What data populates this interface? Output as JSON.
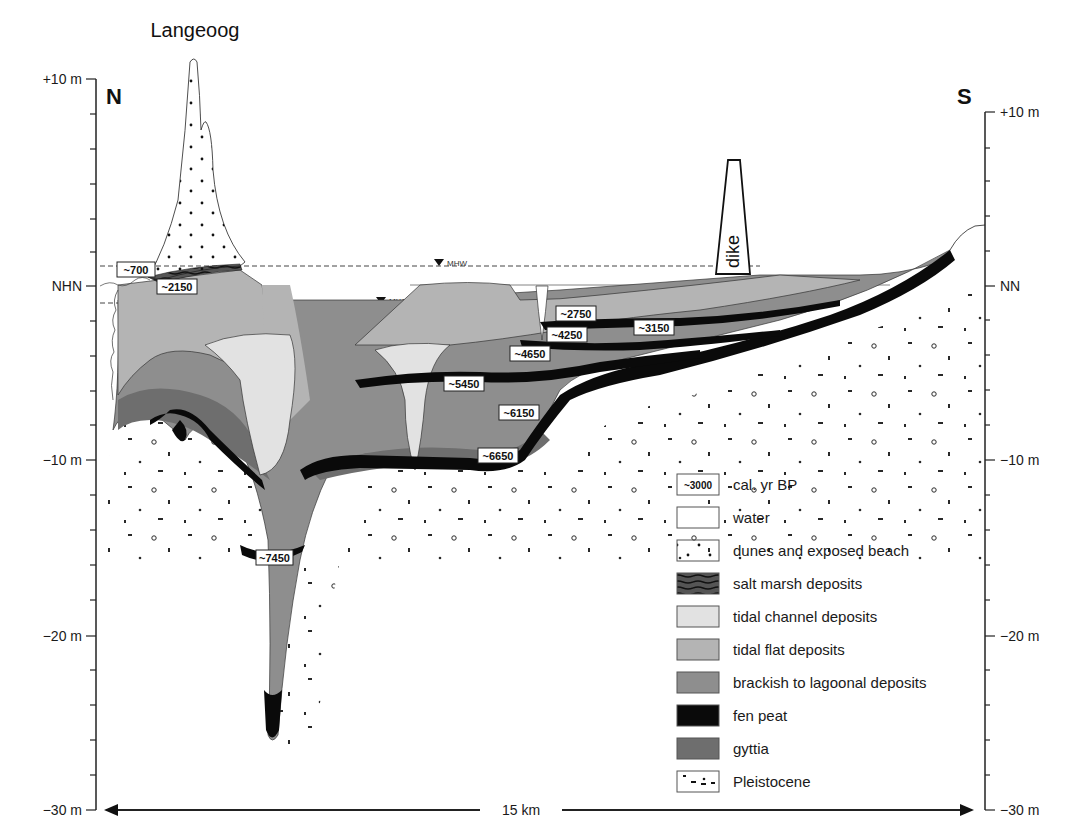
{
  "title": "Langeoog",
  "directions": {
    "left": "N",
    "right": "S"
  },
  "left_axis": {
    "ticks": [
      {
        "label": "+10 m",
        "y": 79
      },
      {
        "label": "NHN",
        "y": 286
      },
      {
        "label": "−10 m",
        "y": 460
      },
      {
        "label": "−20 m",
        "y": 636
      },
      {
        "label": "−30 m",
        "y": 810
      }
    ]
  },
  "right_axis": {
    "ticks": [
      {
        "label": "+10 m",
        "y": 112
      },
      {
        "label": "NN",
        "y": 286
      },
      {
        "label": "−10 m",
        "y": 460
      },
      {
        "label": "−20 m",
        "y": 636
      },
      {
        "label": "−30 m",
        "y": 810
      }
    ]
  },
  "water_levels": {
    "mhw": "MHW",
    "mlw": "MLW"
  },
  "dike_label": "dike",
  "scale_bar": {
    "label": "15 km"
  },
  "age_labels": [
    {
      "text": "~700",
      "x": 117,
      "y": 262
    },
    {
      "text": "~2150",
      "x": 157,
      "y": 279
    },
    {
      "text": "~2750",
      "x": 556,
      "y": 306
    },
    {
      "text": "~3150",
      "x": 634,
      "y": 320
    },
    {
      "text": "~4250",
      "x": 547,
      "y": 327
    },
    {
      "text": "~4650",
      "x": 510,
      "y": 346
    },
    {
      "text": "~5450",
      "x": 444,
      "y": 376
    },
    {
      "text": "~6150",
      "x": 499,
      "y": 405
    },
    {
      "text": "~6650",
      "x": 478,
      "y": 448
    },
    {
      "text": "~7450",
      "x": 256,
      "y": 550
    }
  ],
  "legend": {
    "items": [
      {
        "label": "cal. yr BP",
        "swatch": "age-box",
        "sample": "~3000"
      },
      {
        "label": "water",
        "swatch": "water"
      },
      {
        "label": "dunes and exposed beach",
        "swatch": "dunes"
      },
      {
        "label": "salt marsh deposits",
        "swatch": "saltmarsh"
      },
      {
        "label": "tidal channel deposits",
        "swatch": "channel"
      },
      {
        "label": "tidal flat deposits",
        "swatch": "tidalflat"
      },
      {
        "label": "brackish to lagoonal deposits",
        "swatch": "brackish"
      },
      {
        "label": "fen peat",
        "swatch": "peat"
      },
      {
        "label": "gyttia",
        "swatch": "gyttia"
      },
      {
        "label": "Pleistocene",
        "swatch": "pleistocene"
      }
    ]
  },
  "colors": {
    "water": "#ffffff",
    "channel": "#e2e2e2",
    "tidalflat": "#b4b4b4",
    "brackish": "#8e8e8e",
    "gyttia": "#6e6e6e",
    "peat": "#0a0a0a",
    "saltmarsh": "#3a3a3a"
  }
}
